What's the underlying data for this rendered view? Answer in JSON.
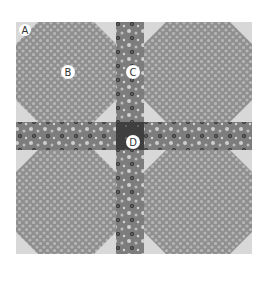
{
  "figure": {
    "labels": {
      "A": "A",
      "B": "B",
      "C": "C",
      "D": "D"
    },
    "colors": {
      "background": "#ffffff",
      "corner_triangle": "#d8d8d8",
      "octagon": "#8f8f8f",
      "octagon_dots": "#b8b8b8",
      "sashing": "#7d7d7d",
      "sashing_dots_light": "#c9c9c9",
      "sashing_dots_dark": "#2e2e2e",
      "center_square": "#3f3f3f",
      "label_bg": "#ffffff",
      "label_text": "#333333"
    }
  }
}
